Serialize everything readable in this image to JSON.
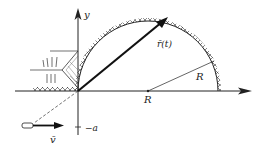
{
  "figure": {
    "labels": {
      "y_axis": "y",
      "position_vector": "r̄(t)",
      "radius_label_inside": "R",
      "radius_label_axis": "R",
      "velocity": "v̄",
      "neg_a": "−a"
    },
    "colors": {
      "ink": "#222222",
      "background": "#ffffff"
    },
    "geometry": {
      "origin": [
        78,
        91
      ],
      "circle_center": [
        148,
        91
      ],
      "radius_px": 70
    }
  }
}
